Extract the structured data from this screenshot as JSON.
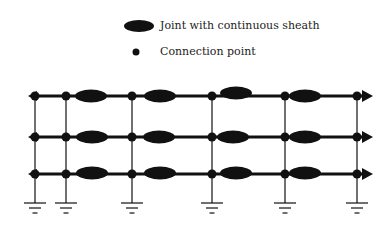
{
  "legend": {
    "items": [
      {
        "symbol": "ellipse",
        "label": "Joint with continuous sheath",
        "x": 160,
        "y": 20
      },
      {
        "symbol": "dot",
        "label": "Connection point",
        "x": 160,
        "y": 46
      }
    ]
  },
  "diagram": {
    "type": "cable-sheath-bonding-schematic",
    "color": "#111111",
    "rows_y": [
      96,
      137,
      174
    ],
    "line_x_start": 28,
    "line_x_end": 373,
    "drops_x": [
      35,
      66,
      132,
      212,
      285,
      357
    ],
    "ground_y": 203,
    "joints": [
      {
        "row": 0,
        "cx": 91,
        "cy": 96
      },
      {
        "row": 0,
        "cx": 160,
        "cy": 96
      },
      {
        "row": 0,
        "cx": 236,
        "cy": 93
      },
      {
        "row": 0,
        "cx": 305,
        "cy": 96
      },
      {
        "row": 1,
        "cx": 92,
        "cy": 137
      },
      {
        "row": 1,
        "cx": 159,
        "cy": 137
      },
      {
        "row": 1,
        "cx": 233,
        "cy": 137
      },
      {
        "row": 1,
        "cx": 305,
        "cy": 137
      },
      {
        "row": 2,
        "cx": 92,
        "cy": 173
      },
      {
        "row": 2,
        "cx": 160,
        "cy": 173
      },
      {
        "row": 2,
        "cx": 236,
        "cy": 173
      },
      {
        "row": 2,
        "cx": 305,
        "cy": 173
      }
    ]
  }
}
